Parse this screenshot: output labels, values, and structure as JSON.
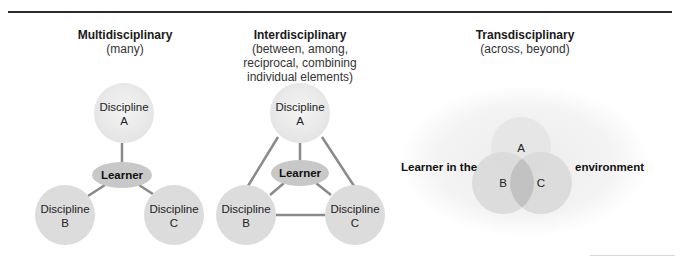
{
  "colors": {
    "circle_fill": "#dcdcdc",
    "circle_a_fill": "#ececec",
    "learner_fill": "#c8c8c8",
    "connector": "#8a8a8a",
    "venn_overlap": "#c4c4c4",
    "environment_fill": "#f2f2f2",
    "rule": "#2a2a2a"
  },
  "panels": [
    {
      "title": "Multidisciplinary",
      "subtitle_lines": [
        "(many)"
      ],
      "nodes": {
        "a": {
          "line1": "Discipline",
          "line2": "A"
        },
        "b": {
          "line1": "Discipline",
          "line2": "B"
        },
        "c": {
          "line1": "Discipline",
          "line2": "C"
        },
        "center": "Learner"
      }
    },
    {
      "title": "Interdisciplinary",
      "subtitle_lines": [
        "(between, among,",
        "reciprocal, combining",
        "individual elements)"
      ],
      "nodes": {
        "a": {
          "line1": "Discipline",
          "line2": "A"
        },
        "b": {
          "line1": "Discipline",
          "line2": "B"
        },
        "c": {
          "line1": "Discipline",
          "line2": "C"
        },
        "center": "Learner"
      }
    },
    {
      "title": "Transdisciplinary",
      "subtitle_lines": [
        "(across, beyond)"
      ],
      "venn": {
        "a": "A",
        "b": "B",
        "c": "C"
      },
      "left_label": "Learner in the",
      "right_label": "environment"
    }
  ]
}
